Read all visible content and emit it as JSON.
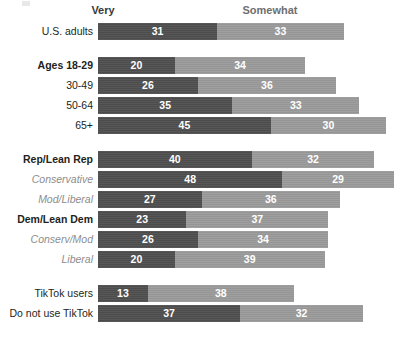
{
  "chart_data": {
    "type": "bar",
    "subtype": "stacked-horizontal",
    "title": "",
    "xlabel": "",
    "ylabel": "",
    "grid": false,
    "legend_position": "top",
    "xlim": [
      0,
      80
    ],
    "series": [
      {
        "name": "Very",
        "color": "#4e4e4e"
      },
      {
        "name": "Somewhat",
        "color": "#9a9a9a"
      }
    ],
    "headers": {
      "very": "Very",
      "somewhat": "Somewhat"
    },
    "groups": [
      {
        "id": "all-adults",
        "rows": [
          {
            "label": "U.S. adults",
            "style": "normal",
            "very": 31,
            "somewhat": 33
          }
        ]
      },
      {
        "id": "age",
        "rows": [
          {
            "label": "Ages 18-29",
            "style": "bold",
            "very": 20,
            "somewhat": 34
          },
          {
            "label": "30-49",
            "style": "normal",
            "very": 26,
            "somewhat": 36
          },
          {
            "label": "50-64",
            "style": "normal",
            "very": 35,
            "somewhat": 33
          },
          {
            "label": "65+",
            "style": "normal",
            "very": 45,
            "somewhat": 30
          }
        ]
      },
      {
        "id": "party",
        "rows": [
          {
            "label": "Rep/Lean Rep",
            "style": "bold",
            "very": 40,
            "somewhat": 32
          },
          {
            "label": "Conservative",
            "style": "sub",
            "very": 48,
            "somewhat": 29
          },
          {
            "label": "Mod/Liberal",
            "style": "sub",
            "very": 27,
            "somewhat": 36
          },
          {
            "label": "Dem/Lean Dem",
            "style": "bold",
            "very": 23,
            "somewhat": 37
          },
          {
            "label": "Conserv/Mod",
            "style": "sub",
            "very": 26,
            "somewhat": 34
          },
          {
            "label": "Liberal",
            "style": "sub",
            "very": 20,
            "somewhat": 39
          }
        ]
      },
      {
        "id": "tiktok-use",
        "rows": [
          {
            "label": "TikTok users",
            "style": "normal",
            "very": 13,
            "somewhat": 38
          },
          {
            "label": "Do not use TikTok",
            "style": "normal",
            "very": 37,
            "somewhat": 32
          }
        ]
      }
    ]
  },
  "layout": {
    "bar_origin_x": 98,
    "px_per_point": 3.84,
    "row_height": 17,
    "row_gap": 3,
    "group_gap": 17,
    "first_row_top": 23
  }
}
